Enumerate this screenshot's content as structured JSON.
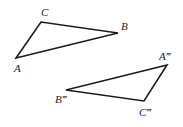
{
  "figure": {
    "width": 183,
    "height": 127,
    "stroke_color": "#1a1a1a",
    "triangles": [
      {
        "name": "ABC",
        "vertices": [
          {
            "label": "A",
            "x": 16,
            "y": 58,
            "lx": 14,
            "ly": 72
          },
          {
            "label": "B",
            "x": 118,
            "y": 33,
            "lx": 121,
            "ly": 30
          },
          {
            "label": "C",
            "x": 41,
            "y": 22,
            "lx": 41,
            "ly": 16
          }
        ]
      },
      {
        "name": "A‴B‴C‴",
        "vertices": [
          {
            "label": "A‴",
            "x": 167,
            "y": 65,
            "lx": 159,
            "ly": 60
          },
          {
            "label": "B‴",
            "x": 66,
            "y": 90,
            "lx": 55,
            "ly": 103
          },
          {
            "label": "C‴",
            "x": 144,
            "y": 101,
            "lx": 139,
            "ly": 116
          }
        ]
      }
    ]
  }
}
